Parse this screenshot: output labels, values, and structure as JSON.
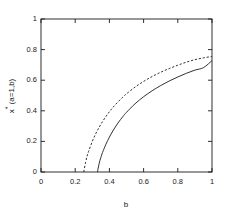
{
  "figure": {
    "background_color": "#ffffff",
    "line_color": "#1a1a1a"
  },
  "axes": {
    "x_title": "b",
    "y_title_main": "x",
    "y_title_star": "*",
    "y_title_args": " (a=1,b)",
    "x_ticks": [
      "0",
      "0.2",
      "0.4",
      "0.6",
      "0.8",
      "1"
    ],
    "y_ticks": [
      "0",
      "0.2",
      "0.4",
      "0.6",
      "0.8",
      "1"
    ]
  },
  "chart_data": {
    "type": "line",
    "title": "",
    "xlabel": "b",
    "ylabel": "x* (a=1,b)",
    "xlim": [
      0,
      1
    ],
    "ylim": [
      0,
      1
    ],
    "grid": false,
    "legend": "none",
    "x_ticks": [
      0,
      0.2,
      0.4,
      0.6,
      0.8,
      1
    ],
    "y_ticks": [
      0,
      0.2,
      0.4,
      0.6,
      0.8,
      1
    ],
    "series": [
      {
        "name": "upper branch",
        "style": "dashed",
        "color": "#1a1a1a",
        "x": [
          0.25,
          0.26,
          0.27,
          0.28,
          0.3,
          0.32,
          0.34,
          0.36,
          0.38,
          0.4,
          0.42,
          0.45,
          0.48,
          0.5,
          0.55,
          0.6,
          0.65,
          0.7,
          0.75,
          0.8,
          0.85,
          0.9,
          0.95,
          1.0
        ],
        "y": [
          0.0,
          0.06,
          0.105,
          0.14,
          0.2,
          0.25,
          0.292,
          0.33,
          0.363,
          0.394,
          0.421,
          0.458,
          0.491,
          0.511,
          0.555,
          0.592,
          0.624,
          0.652,
          0.676,
          0.698,
          0.718,
          0.734,
          0.746,
          0.755
        ]
      },
      {
        "name": "lower branch",
        "style": "solid",
        "color": "#1a1a1a",
        "x": [
          0.33,
          0.34,
          0.35,
          0.36,
          0.38,
          0.4,
          0.42,
          0.45,
          0.48,
          0.5,
          0.55,
          0.6,
          0.65,
          0.7,
          0.75,
          0.8,
          0.85,
          0.9,
          0.95,
          1.0
        ],
        "y": [
          0.0,
          0.055,
          0.095,
          0.128,
          0.182,
          0.228,
          0.268,
          0.32,
          0.364,
          0.39,
          0.446,
          0.492,
          0.531,
          0.565,
          0.595,
          0.621,
          0.645,
          0.666,
          0.682,
          0.728
        ]
      }
    ]
  },
  "tick_positions": {
    "plot_left": 41,
    "plot_right": 212,
    "plot_top": 19,
    "plot_bottom": 172
  }
}
